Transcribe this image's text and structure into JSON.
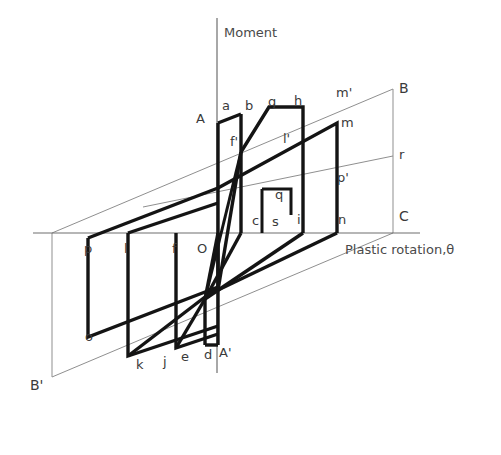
{
  "figure": {
    "type": "diagram",
    "axes": {
      "vertical_label": "Moment",
      "horizontal_label": "Plastic rotation,θ",
      "origin_label": "O"
    },
    "colors": {
      "thick_curve": "#1a1a1a",
      "thin_guide": "#8c8c8c",
      "axis": "#6e6e6e",
      "label_text": "#3a3a3a",
      "background": "#ffffff"
    },
    "envelope_labels": {
      "upper_right": "B",
      "lower_left": "B'",
      "corner": "C",
      "upper_left_start": "A",
      "lower_right_start": "A'",
      "mid_right": "r"
    },
    "point_labels": [
      {
        "id": "A",
        "text": "A",
        "x": 205,
        "y": 123,
        "anchor": "end"
      },
      {
        "id": "a",
        "text": "a",
        "x": 222,
        "y": 110,
        "anchor": "start"
      },
      {
        "id": "b",
        "text": "b",
        "x": 245,
        "y": 110,
        "anchor": "start"
      },
      {
        "id": "g",
        "text": "g",
        "x": 268,
        "y": 106,
        "anchor": "start"
      },
      {
        "id": "h",
        "text": "h",
        "x": 294,
        "y": 105,
        "anchor": "start"
      },
      {
        "id": "mp",
        "text": "m'",
        "x": 336,
        "y": 97,
        "anchor": "start"
      },
      {
        "id": "B",
        "text": "B",
        "x": 399,
        "y": 93,
        "anchor": "start"
      },
      {
        "id": "m",
        "text": "m",
        "x": 341,
        "y": 127,
        "anchor": "start"
      },
      {
        "id": "fp",
        "text": "f'",
        "x": 230,
        "y": 146,
        "anchor": "start"
      },
      {
        "id": "lp",
        "text": "l'",
        "x": 283,
        "y": 143,
        "anchor": "start"
      },
      {
        "id": "r",
        "text": "r",
        "x": 399,
        "y": 159,
        "anchor": "start"
      },
      {
        "id": "pp",
        "text": "p'",
        "x": 337,
        "y": 182,
        "anchor": "start"
      },
      {
        "id": "q",
        "text": "q",
        "x": 275,
        "y": 199,
        "anchor": "start"
      },
      {
        "id": "c",
        "text": "c",
        "x": 252,
        "y": 225,
        "anchor": "start"
      },
      {
        "id": "s",
        "text": "s",
        "x": 272,
        "y": 226,
        "anchor": "start"
      },
      {
        "id": "i",
        "text": "i",
        "x": 297,
        "y": 224,
        "anchor": "start"
      },
      {
        "id": "n",
        "text": "n",
        "x": 338,
        "y": 224,
        "anchor": "start"
      },
      {
        "id": "C",
        "text": "C",
        "x": 399,
        "y": 221,
        "anchor": "start"
      },
      {
        "id": "p",
        "text": "p",
        "x": 84,
        "y": 253,
        "anchor": "start"
      },
      {
        "id": "l",
        "text": "l",
        "x": 124,
        "y": 253,
        "anchor": "start"
      },
      {
        "id": "f",
        "text": "f",
        "x": 172,
        "y": 253,
        "anchor": "start"
      },
      {
        "id": "O",
        "text": "O",
        "x": 197,
        "y": 253,
        "anchor": "start"
      },
      {
        "id": "o",
        "text": "o",
        "x": 85,
        "y": 341,
        "anchor": "start"
      },
      {
        "id": "k",
        "text": "k",
        "x": 136,
        "y": 369,
        "anchor": "start"
      },
      {
        "id": "j",
        "text": "j",
        "x": 163,
        "y": 366,
        "anchor": "start"
      },
      {
        "id": "e",
        "text": "e",
        "x": 181,
        "y": 361,
        "anchor": "start"
      },
      {
        "id": "d",
        "text": "d",
        "x": 204,
        "y": 359,
        "anchor": "start"
      },
      {
        "id": "Ap",
        "text": "A'",
        "x": 219,
        "y": 357,
        "anchor": "start"
      },
      {
        "id": "Bp",
        "text": "B'",
        "x": 30,
        "y": 390,
        "anchor": "start"
      }
    ]
  },
  "geometry": {
    "axis_horizontal": {
      "x1": 33,
      "y1": 233,
      "x2": 420,
      "y2": 233
    },
    "axis_vertical": {
      "x1": 217,
      "y1": 18,
      "x2": 217,
      "y2": 373
    },
    "guide_B_line": {
      "x1": 52,
      "y1": 233,
      "x2": 393,
      "y2": 89
    },
    "guide_Bp_line": {
      "x1": 52,
      "y1": 377,
      "x2": 393,
      "y2": 233
    },
    "guide_r_line": {
      "x1": 150,
      "y1": 205,
      "x2": 393,
      "y2": 156
    },
    "guide_BC_vert": {
      "x1": 393,
      "y1": 89,
      "x2": 393,
      "y2": 233
    },
    "guide_Bp_vert": {
      "x1": 52,
      "y1": 233,
      "x2": 52,
      "y2": 377
    },
    "loop_thick_path": "M 88,238 L 217,188 M 88,238 L 88,337 L 217,287 M 127,233 L 127,355 M 127,355 L 217,325 M 175,233 L 175,347 M 175,347 L 217,337 M 217,123 L 217,287 M 240,113 L 240,233 M 217,123 L 240,113 L 240,233 M 262,188 L 262,233 M 262,188 L 290,181 M 290,181 L 290,213 M 217,188 L 336,123 M 336,123 L 336,233 M 269,106 L 302,106 L 302,233 M 240,152 L 269,106 M 217,233 L 217,345 M 217,345 L 205,345 M 205,345 L 205,300",
    "notes": "thick polylines forming nested parallelogram hysteresis loops"
  }
}
